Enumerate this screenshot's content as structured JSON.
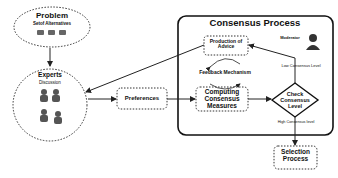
{
  "diagram": {
    "problem": {
      "title": "Problem",
      "subtitle": "Setof Alternatives"
    },
    "experts": {
      "title": "Experts",
      "subtitle": "Discussion"
    },
    "preferences": {
      "label": "Preferences"
    },
    "consensus_process": {
      "title": "Consensus Process",
      "production_of_advice": "Production of Advice",
      "feedback_mechanism": "Feedback Mechanism",
      "computing_consensus_measures": "Computing Consensus Measures",
      "moderator": "Moderator",
      "check_consensus_level": "Check Consensus Level",
      "low_consensus_level": "Low Consensus Level",
      "high_consensus_level": "High Consensus level"
    },
    "selection_process": {
      "label": "Selection Process"
    }
  }
}
